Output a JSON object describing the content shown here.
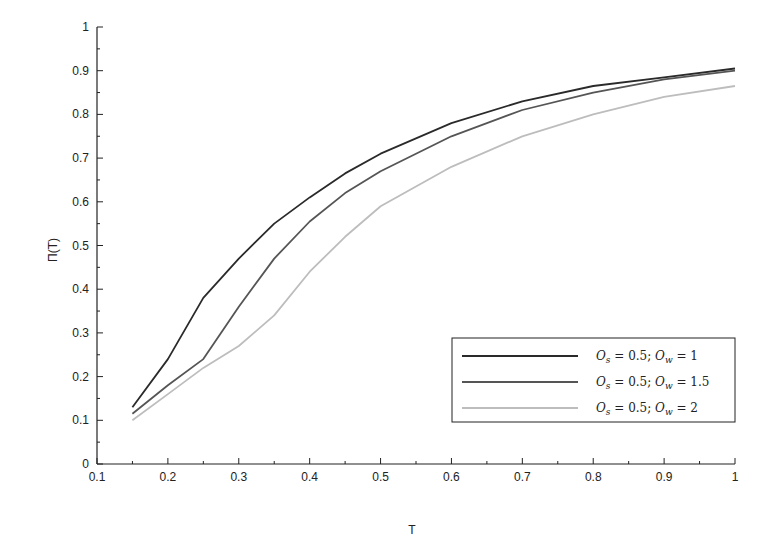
{
  "chart_data": {
    "type": "line",
    "title": "",
    "xlabel": "T",
    "ylabel": "Π(T)",
    "xlim": [
      0.1,
      1
    ],
    "ylim": [
      0,
      1
    ],
    "grid": false,
    "legend_position": "lower right",
    "xticks": [
      "0.1",
      "0.2",
      "0.3",
      "0.4",
      "0.5",
      "0.6",
      "0.7",
      "0.8",
      "0.9",
      "1"
    ],
    "yticks": [
      "0",
      "0.1",
      "0.2",
      "0.3",
      "0.4",
      "0.5",
      "0.6",
      "0.7",
      "0.8",
      "0.9",
      "1"
    ],
    "x": [
      0.15,
      0.2,
      0.25,
      0.3,
      0.35,
      0.4,
      0.45,
      0.5,
      0.6,
      0.7,
      0.8,
      0.9,
      1.0
    ],
    "series": [
      {
        "name": "O_s = 0.5; O_w = 1",
        "color": "#2a2a2a",
        "values": [
          0.13,
          0.24,
          0.38,
          0.47,
          0.55,
          0.61,
          0.665,
          0.71,
          0.78,
          0.83,
          0.865,
          0.885,
          0.905
        ]
      },
      {
        "name": "O_s = 0.5; O_w = 1.5",
        "color": "#555555",
        "values": [
          0.115,
          0.18,
          0.24,
          0.36,
          0.47,
          0.555,
          0.62,
          0.67,
          0.75,
          0.81,
          0.85,
          0.88,
          0.9
        ]
      },
      {
        "name": "O_s = 0.5; O_w = 2",
        "color": "#bdbdbd",
        "values": [
          0.1,
          0.16,
          0.22,
          0.27,
          0.34,
          0.44,
          0.52,
          0.59,
          0.68,
          0.75,
          0.8,
          0.84,
          0.865
        ]
      }
    ]
  },
  "legend": {
    "entries": [
      {
        "os": "0.5",
        "ow": "1"
      },
      {
        "os": "0.5",
        "ow": "1.5"
      },
      {
        "os": "0.5",
        "ow": "2"
      }
    ]
  }
}
